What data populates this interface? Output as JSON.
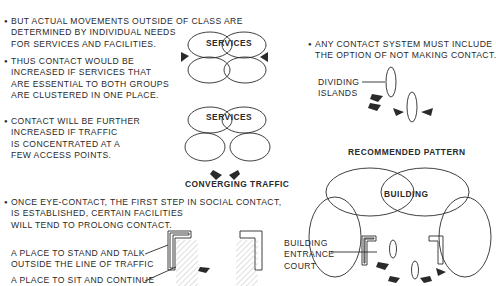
{
  "bullets": [
    {
      "lines": [
        "BUT ACTUAL MOVEMENTS OUTSIDE OF CLASS ARE",
        "DETERMINED BY INDIVIDUAL NEEDS",
        "FOR SERVICES AND FACILITIES."
      ]
    },
    {
      "lines": [
        "THUS CONTACT WOULD BE",
        "INCREASED IF SERVICES THAT",
        "ARE ESSENTIAL TO BOTH GROUPS",
        "ARE CLUSTERED IN ONE PLACE."
      ]
    },
    {
      "lines": [
        "CONTACT WILL BE FURTHER",
        "INCREASED IF TRAFFIC",
        "IS CONCENTRATED AT A",
        "FEW ACCESS POINTS."
      ]
    },
    {
      "lines": [
        "ONCE EYE-CONTACT, THE FIRST STEP IN SOCIAL CONTACT,",
        "IS ESTABLISHED, CERTAIN FACILITIES",
        "WILL TEND TO PROLONG CONTACT."
      ]
    },
    {
      "lines": [
        "ANY CONTACT SYSTEM MUST INCLUDE",
        "THE OPTION OF NOT MAKING CONTACT."
      ]
    }
  ],
  "callouts": {
    "stand": "A PLACE TO STAND AND TALK",
    "stand2": "OUTSIDE THE LINE OF TRAFFIC",
    "sit": "A PLACE TO SIT AND CONTINUE",
    "islands": [
      "DIVIDING",
      "ISLANDS"
    ],
    "court": [
      "BUILDING",
      "ENTRANCE",
      "COURT"
    ]
  },
  "diagram_labels": {
    "services_1": "SERVICES",
    "services_2": "SERVICES",
    "converging": "CONVERGING TRAFFIC",
    "recommended": "RECOMMENDED PATTERN",
    "building": "BUILDING"
  }
}
